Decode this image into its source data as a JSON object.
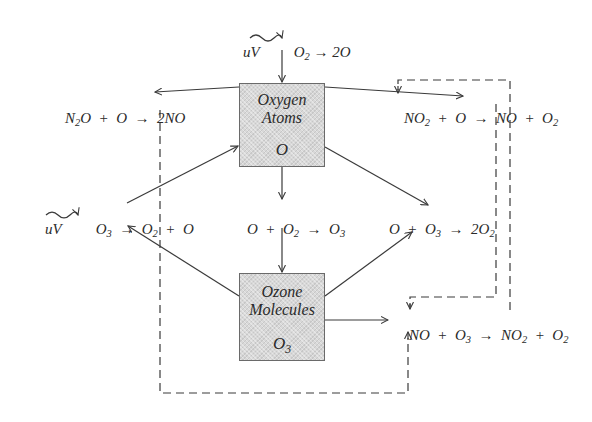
{
  "diagram": {
    "nodes": {
      "oxygen_atoms": {
        "title_line1": "Oxygen",
        "title_line2": "Atoms",
        "symbol": "O"
      },
      "ozone_molecules": {
        "title_line1": "Ozone",
        "title_line2": "Molecules",
        "symbol": "O",
        "symbol_sub": "3"
      }
    },
    "reactions": {
      "uv_o2": {
        "lhs": "uV",
        "reactant": "O",
        "reactant_sub": "2",
        "arrow": "→",
        "product": "2O"
      },
      "n2o_o": {
        "a": "N",
        "a_sub": "2",
        "a_rest": "O",
        "plus": "+",
        "b": "O",
        "arrow": "→",
        "product": "2NO"
      },
      "no2_o": {
        "a": "NO",
        "a_sub": "2",
        "plus1": "+",
        "b": "O",
        "arrow": "→",
        "c": "NO",
        "plus2": "+",
        "d": "O",
        "d_sub": "2"
      },
      "uv_o3": {
        "lhs": "uV",
        "reactant": "O",
        "reactant_sub": "3",
        "arrow": "→",
        "p1": "O",
        "p1_sub": "2",
        "plus": "+",
        "p2": "O"
      },
      "o_o2": {
        "a": "O",
        "plus": "+",
        "b": "O",
        "b_sub": "2",
        "arrow": "→",
        "product": "O",
        "product_sub": "3"
      },
      "o_o3": {
        "a": "O",
        "plus": "+",
        "b": "O",
        "b_sub": "3",
        "arrow": "→",
        "product": "2O",
        "product_sub": "2"
      },
      "no_o3": {
        "a": "NO",
        "plus1": "+",
        "b": "O",
        "b_sub": "3",
        "arrow": "→",
        "c": "NO",
        "c_sub": "2",
        "plus2": "+",
        "d": "O",
        "d_sub": "2"
      }
    },
    "colors": {
      "line": "#3a3a3a",
      "box_fill": "#d8d8d8",
      "box_border": "#6a6a6a"
    }
  }
}
